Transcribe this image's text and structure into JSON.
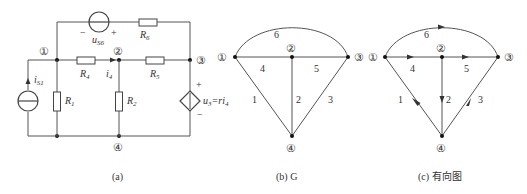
{
  "circuit_a": {
    "caption": "(a)",
    "nodes": {
      "n1": "①",
      "n2": "②",
      "n3": "③",
      "n4": "④"
    },
    "components": {
      "R1": "R",
      "R1_sub": "1",
      "R2": "R",
      "R2_sub": "2",
      "R4": "R",
      "R4_sub": "4",
      "R5": "R",
      "R5_sub": "5",
      "R6": "R",
      "R6_sub": "6",
      "iS1": "i",
      "iS1_sub": "S1",
      "uS6": "u",
      "uS6_sub": "S6",
      "i4": "i",
      "i4_sub": "4",
      "u3_label": "u",
      "u3_sub": "3",
      "u3_eq": "=ri",
      "u3_eq_sub": "4",
      "plus": "+",
      "minus": "−"
    }
  },
  "graph_b": {
    "caption": "(b) G",
    "nodes": {
      "n1": "①",
      "n2": "②",
      "n3": "③",
      "n4": "④"
    },
    "edges": {
      "e1": "1",
      "e2": "2",
      "e3": "3",
      "e4": "4",
      "e5": "5",
      "e6": "6"
    }
  },
  "graph_c": {
    "caption": "(c) 有向图",
    "nodes": {
      "n1": "①",
      "n2": "②",
      "n3": "③",
      "n4": "④"
    },
    "edges": {
      "e1": "1",
      "e2": "2",
      "e3": "3",
      "e4": "4",
      "e5": "5",
      "e6": "6"
    }
  }
}
